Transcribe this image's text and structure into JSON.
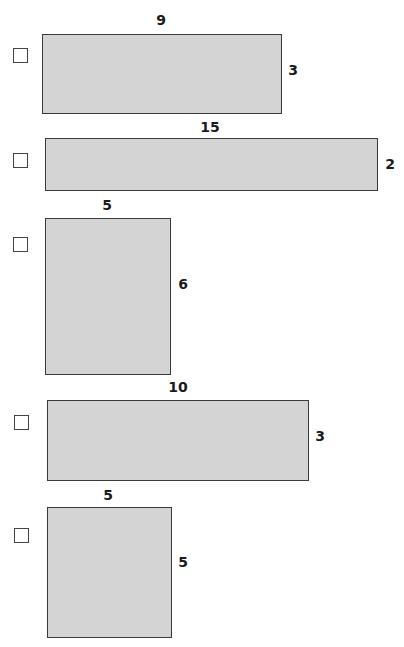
{
  "colors": {
    "fill": "#d4d4d4",
    "border": "#3a3a3a",
    "text": "#1a1a1a"
  },
  "items": [
    {
      "width_label": "9",
      "height_label": "3",
      "checked": false,
      "rect": {
        "x": 42,
        "y": 34,
        "w": 240,
        "h": 80
      },
      "checkbox": {
        "x": 13,
        "y": 48
      },
      "top_label_pos": {
        "x": 161,
        "y": 20
      },
      "side_label_pos": {
        "x": 293,
        "y": 70
      }
    },
    {
      "width_label": "15",
      "height_label": "2",
      "checked": false,
      "rect": {
        "x": 45,
        "y": 138,
        "w": 333,
        "h": 53
      },
      "checkbox": {
        "x": 13,
        "y": 153
      },
      "top_label_pos": {
        "x": 210,
        "y": 127
      },
      "side_label_pos": {
        "x": 390,
        "y": 164
      }
    },
    {
      "width_label": "5",
      "height_label": "6",
      "checked": false,
      "rect": {
        "x": 45,
        "y": 218,
        "w": 126,
        "h": 157
      },
      "checkbox": {
        "x": 13,
        "y": 237
      },
      "top_label_pos": {
        "x": 107,
        "y": 205
      },
      "side_label_pos": {
        "x": 183,
        "y": 284
      }
    },
    {
      "width_label": "10",
      "height_label": "3",
      "checked": false,
      "rect": {
        "x": 47,
        "y": 400,
        "w": 262,
        "h": 81
      },
      "checkbox": {
        "x": 14,
        "y": 415
      },
      "top_label_pos": {
        "x": 178,
        "y": 387
      },
      "side_label_pos": {
        "x": 320,
        "y": 436
      }
    },
    {
      "width_label": "5",
      "height_label": "5",
      "checked": false,
      "rect": {
        "x": 47,
        "y": 507,
        "w": 125,
        "h": 131
      },
      "checkbox": {
        "x": 14,
        "y": 528
      },
      "top_label_pos": {
        "x": 108,
        "y": 495
      },
      "side_label_pos": {
        "x": 183,
        "y": 562
      }
    }
  ]
}
